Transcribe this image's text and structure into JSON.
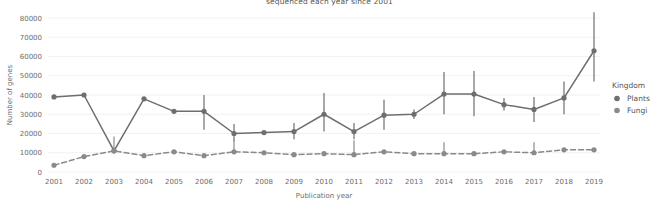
{
  "chart_data": {
    "type": "line",
    "title": "sequenced each year since 2001",
    "xlabel": "Publication year",
    "ylabel": "Number of genes",
    "categories": [
      "2001",
      "2002",
      "2003",
      "2004",
      "2005",
      "2006",
      "2007",
      "2008",
      "2009",
      "2010",
      "2011",
      "2012",
      "2013",
      "2014",
      "2015",
      "2016",
      "2017",
      "2018",
      "2019"
    ],
    "x": [
      2001,
      2002,
      2003,
      2004,
      2005,
      2006,
      2007,
      2008,
      2009,
      2010,
      2011,
      2012,
      2013,
      2014,
      2015,
      2016,
      2017,
      2018,
      2019
    ],
    "ylim": [
      0,
      80000
    ],
    "yticks": [
      0,
      10000,
      20000,
      30000,
      40000,
      50000,
      60000,
      70000,
      80000
    ],
    "ytick_labels": [
      "0",
      "10000",
      "20000",
      "30000",
      "40000",
      "50000",
      "60000",
      "70000",
      "80000"
    ],
    "grid": true,
    "legend_position": "right",
    "legend_title": "Kingdom",
    "series": [
      {
        "name": "Plants",
        "style": "solid",
        "color": "#6e6e6e",
        "values": [
          39000,
          40000,
          11000,
          38000,
          31500,
          31500,
          20000,
          20500,
          21000,
          30000,
          21000,
          29500,
          30000,
          40500,
          40500,
          35000,
          32500,
          38500,
          63000
        ],
        "err_low": [
          39000,
          40000,
          11000,
          38000,
          31500,
          22000,
          16000,
          20500,
          17000,
          21000,
          17000,
          22000,
          27500,
          30000,
          29000,
          32000,
          26000,
          30000,
          47000
        ],
        "err_high": [
          39000,
          40000,
          11000,
          38000,
          31500,
          40000,
          25000,
          20500,
          25500,
          41000,
          25500,
          37500,
          32500,
          52000,
          52500,
          38500,
          39000,
          47000,
          83000
        ]
      },
      {
        "name": "Fungi",
        "style": "dashed",
        "color": "#8a8a8a",
        "values": [
          3500,
          8000,
          11000,
          8500,
          10500,
          8500,
          10500,
          10000,
          9000,
          9500,
          9000,
          10500,
          9500,
          9500,
          9500,
          10500,
          10000,
          11500,
          11500
        ],
        "err_low": [
          3500,
          8000,
          11000,
          8500,
          10500,
          8500,
          10500,
          10000,
          9000,
          9500,
          9000,
          10500,
          9500,
          9500,
          9500,
          10500,
          10000,
          11500,
          11500
        ],
        "err_high": [
          3500,
          8000,
          18500,
          8500,
          10500,
          8500,
          16500,
          10000,
          9000,
          9500,
          16500,
          10500,
          9500,
          15500,
          9500,
          10500,
          15500,
          11500,
          11500
        ]
      }
    ]
  },
  "legend": {
    "title": "Kingdom",
    "items": [
      {
        "label": "Plants",
        "color": "#6e6e6e"
      },
      {
        "label": "Fungi",
        "color": "#8a8a8a"
      }
    ]
  },
  "colors": {
    "plants": "#6e6e6e",
    "fungi": "#8a8a8a",
    "grid": "#f2f2f2",
    "text": "#6b6b6b",
    "background": "#ffffff"
  }
}
